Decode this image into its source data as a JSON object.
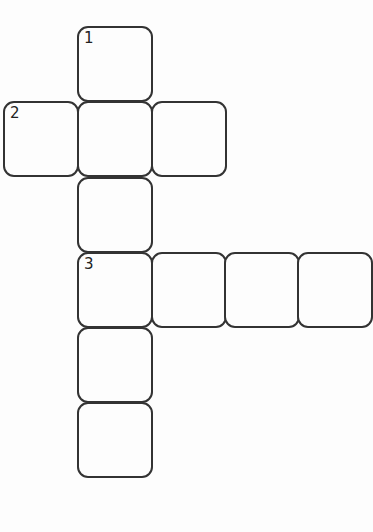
{
  "puzzle": {
    "type": "crossword",
    "colors": {
      "border": "#333333",
      "background": "#fdfdfd",
      "number": "#222222"
    },
    "cells": [
      {
        "id": "r0c1",
        "x": 77,
        "y": 26,
        "number": "1"
      },
      {
        "id": "r1c0",
        "x": 3,
        "y": 101,
        "number": "2"
      },
      {
        "id": "r1c1",
        "x": 77,
        "y": 101,
        "number": ""
      },
      {
        "id": "r1c2",
        "x": 151,
        "y": 101,
        "number": ""
      },
      {
        "id": "r2c1",
        "x": 77,
        "y": 177,
        "number": ""
      },
      {
        "id": "r3c1",
        "x": 77,
        "y": 252,
        "number": "3"
      },
      {
        "id": "r3c2",
        "x": 151,
        "y": 252,
        "number": ""
      },
      {
        "id": "r3c3",
        "x": 224,
        "y": 252,
        "number": ""
      },
      {
        "id": "r3c4",
        "x": 297,
        "y": 252,
        "number": ""
      },
      {
        "id": "r4c1",
        "x": 77,
        "y": 327,
        "number": ""
      },
      {
        "id": "r5c1",
        "x": 77,
        "y": 402,
        "number": ""
      }
    ],
    "entries": [
      {
        "number": "1",
        "direction": "down",
        "length": 6
      },
      {
        "number": "2",
        "direction": "across",
        "length": 3
      },
      {
        "number": "3",
        "direction": "across",
        "length": 4
      }
    ]
  }
}
